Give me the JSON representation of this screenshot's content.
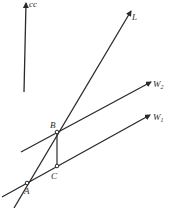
{
  "diagram": {
    "type": "geometric-vector-diagram",
    "colors": {
      "background": "#ffffff",
      "ink": "#2a2a2a"
    },
    "labels": {
      "vertical_arrow": "cc",
      "line_L": "L",
      "line_W2": "W",
      "line_W2_sub": "2",
      "line_W1": "W",
      "line_W1_sub": "1",
      "point_A": "A",
      "point_B": "B",
      "point_C": "C"
    },
    "points": {
      "A": [
        27,
        183
      ],
      "B": [
        57,
        132
      ],
      "C": [
        57,
        166
      ]
    },
    "lines": [
      {
        "name": "cc",
        "from": [
          24,
          92
        ],
        "to": [
          26,
          2
        ],
        "arrow": true
      },
      {
        "name": "L",
        "from": [
          14,
          208
        ],
        "to": [
          131,
          11
        ],
        "arrow": true
      },
      {
        "name": "W2",
        "from": [
          21,
          152
        ],
        "to": [
          151,
          82
        ],
        "arrow": true
      },
      {
        "name": "W1",
        "from": [
          2,
          197
        ],
        "to": [
          150,
          115
        ],
        "arrow": true
      },
      {
        "name": "BC",
        "from": [
          57,
          132
        ],
        "to": [
          57,
          166
        ],
        "arrow": false
      }
    ]
  }
}
